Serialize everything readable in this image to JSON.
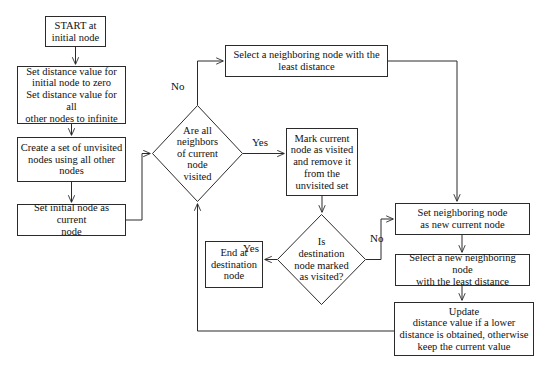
{
  "diagram": {
    "line_color": "#2b2b2b",
    "text_color": "#111111",
    "background": "#ffffff",
    "nodes": [
      {
        "id": "start",
        "shape": "rect",
        "label": "START at\ninitial node",
        "x": 45,
        "y": 16,
        "w": 61,
        "h": 31,
        "font": 10.5
      },
      {
        "id": "set_distance",
        "shape": "rect",
        "label": "Set distance value for\ninitial node to zero\nSet distance value for all\nother nodes to infinite",
        "x": 17,
        "y": 66,
        "w": 109,
        "h": 58,
        "font": 10.5
      },
      {
        "id": "create_unvisited",
        "shape": "rect",
        "label": "Create a set of unvisited\nnodes using all other\nnodes",
        "x": 17,
        "y": 137,
        "w": 109,
        "h": 45,
        "font": 10.5
      },
      {
        "id": "set_initial_current",
        "shape": "rect",
        "label": "Set initial node as current\nnode",
        "x": 17,
        "y": 204,
        "w": 109,
        "h": 32,
        "font": 10.5
      },
      {
        "id": "select_neighbor",
        "shape": "rect",
        "label": "Select a neighboring node with the\nleast distance",
        "x": 225,
        "y": 45,
        "w": 163,
        "h": 32,
        "font": 10.5
      },
      {
        "id": "all_neighbors_visited",
        "shape": "diamond",
        "label": "Are all\nneighbors\nof current\nnode\nvisited",
        "x": 152,
        "y": 105,
        "w": 91,
        "h": 97,
        "font": 10.5
      },
      {
        "id": "mark_visited",
        "shape": "rect",
        "label": "Mark current\nnode as visited\nand remove it\nfrom the\nunvisited set",
        "x": 286,
        "y": 128,
        "w": 72,
        "h": 68,
        "font": 10.5
      },
      {
        "id": "is_destination_visited",
        "shape": "diamond",
        "label": "Is\ndestination\nnode marked\nas visited?",
        "x": 277,
        "y": 214,
        "w": 89,
        "h": 91,
        "font": 10.5
      },
      {
        "id": "end_destination",
        "shape": "rect",
        "label": "End at\ndestination\nnode",
        "x": 205,
        "y": 241,
        "w": 58,
        "h": 47,
        "font": 10.5
      },
      {
        "id": "set_neighbor_current",
        "shape": "rect",
        "label": "Set neighboring node\nas new current node",
        "x": 395,
        "y": 203,
        "w": 135,
        "h": 32,
        "font": 10.5
      },
      {
        "id": "select_new_neighbor",
        "shape": "rect",
        "label": "Select a new neighboring node\nwith the least distance",
        "x": 395,
        "y": 254,
        "w": 135,
        "h": 32,
        "font": 10.5
      },
      {
        "id": "update_distance",
        "shape": "rect",
        "label": "Update\ndistance value if a lower\ndistance is obtained, otherwise\nkeep the current value",
        "x": 394,
        "y": 302,
        "w": 140,
        "h": 54,
        "font": 10.5
      }
    ],
    "edge_labels": [
      {
        "id": "no_all_neighbors",
        "text": "No",
        "x": 171,
        "y": 81,
        "font": 11
      },
      {
        "id": "yes_all_neighbors",
        "text": "Yes",
        "x": 252,
        "y": 137,
        "font": 11
      },
      {
        "id": "no_is_destination",
        "text": "No",
        "x": 370,
        "y": 233,
        "font": 11
      },
      {
        "id": "yes_is_destination",
        "text": "Yes",
        "x": 243,
        "y": 243,
        "font": 11
      }
    ],
    "edges": [
      {
        "id": "start-to-set-distance",
        "from": "start",
        "to": "set_distance",
        "path": "M 75.5 47 L 75.5 64",
        "arrow": true
      },
      {
        "id": "set-distance-to-create",
        "from": "set_distance",
        "to": "create_unvisited",
        "path": "M 71.5 124 L 71.5 135",
        "arrow": true
      },
      {
        "id": "create-to-set-initial",
        "from": "create_unvisited",
        "to": "set_initial_current",
        "path": "M 71.5 182 L 71.5 202",
        "arrow": true
      },
      {
        "id": "set-initial-to-diamond1",
        "from": "set_initial_current",
        "to": "all_neighbors_visited",
        "path": "M 126 220 L 142 220 L 142 153.5 L 150 153.5",
        "arrow": true
      },
      {
        "id": "diamond1-no-to-select-neighbor",
        "from": "all_neighbors_visited",
        "to": "select_neighbor",
        "path": "M 197.5 105 L 197.5 61 L 223 61",
        "arrow": true
      },
      {
        "id": "diamond1-yes-to-mark-visited",
        "from": "all_neighbors_visited",
        "to": "mark_visited",
        "path": "M 243 153.5 L 284 153.5",
        "arrow": true
      },
      {
        "id": "select-neighbor-to-set-neighbor-current",
        "from": "select_neighbor",
        "to": "set_neighbor_current",
        "path": "M 388 61 L 457 61 L 457 201",
        "arrow": true
      },
      {
        "id": "mark-visited-to-diamond2",
        "from": "mark_visited",
        "to": "is_destination_visited",
        "path": "M 322 196 L 322 212",
        "arrow": true
      },
      {
        "id": "diamond2-yes-to-end",
        "from": "is_destination_visited",
        "to": "end_destination",
        "path": "M 277 259.5 L 265 259.5",
        "arrow": true
      },
      {
        "id": "diamond2-no-to-set-neighbor-current",
        "from": "is_destination_visited",
        "to": "set_neighbor_current",
        "path": "M 366 259.5 L 381 259.5 L 381 219 L 393 219",
        "arrow": true
      },
      {
        "id": "set-neighbor-current-to-select-new",
        "from": "set_neighbor_current",
        "to": "select_new_neighbor",
        "path": "M 462 235 L 462 252",
        "arrow": true
      },
      {
        "id": "select-new-to-update",
        "from": "select_new_neighbor",
        "to": "update_distance",
        "path": "M 462 286 L 462 300",
        "arrow": true
      },
      {
        "id": "update-back-to-diamond1",
        "from": "update_distance",
        "to": "all_neighbors_visited",
        "path": "M 394 331 L 197.5 331 L 197.5 204",
        "arrow": true
      }
    ]
  }
}
